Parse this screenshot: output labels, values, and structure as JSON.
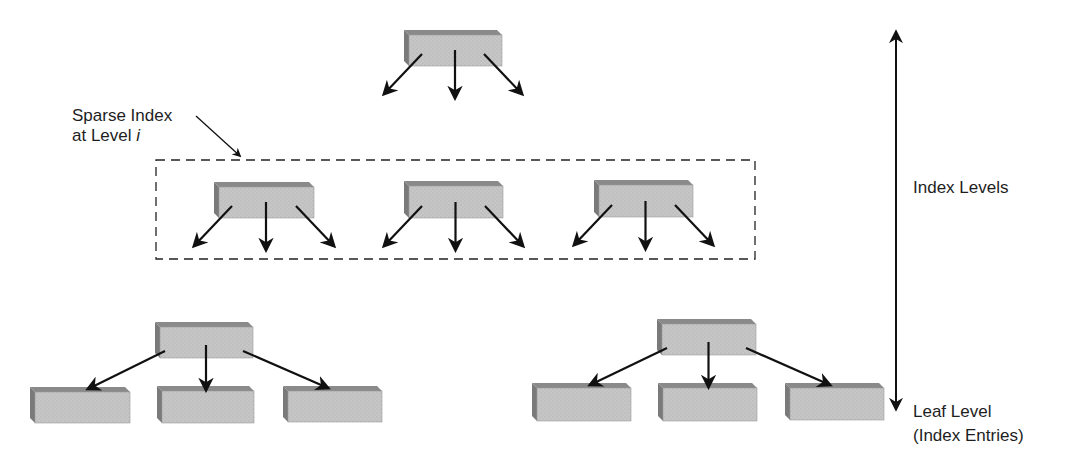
{
  "labels": {
    "sparse_index_line1": "Sparse Index",
    "sparse_index_line2_prefix": "at Level ",
    "sparse_index_line2_var": "i",
    "index_levels": "Index Levels",
    "leaf_level_line1": "Leaf Level",
    "leaf_level_line2": "(Index Entries)"
  },
  "colors": {
    "box_face": "#c4c4c4",
    "box_top": "#8a8a8a",
    "box_side": "#7a7a7a",
    "arrow": "#111111",
    "dashed_border": "#222222",
    "background": "#ffffff"
  },
  "diagram": {
    "root_box": {
      "x": 404,
      "y": 30,
      "w": 98,
      "h": 36
    },
    "sparse_level_group": {
      "x": 156,
      "y": 160,
      "w": 599,
      "h": 99
    },
    "sparse_level_boxes": [
      {
        "x": 214,
        "y": 182,
        "w": 100,
        "h": 36
      },
      {
        "x": 404,
        "y": 181,
        "w": 99,
        "h": 37
      },
      {
        "x": 594,
        "y": 180,
        "w": 99,
        "h": 37
      }
    ],
    "subtrees": [
      {
        "parent": {
          "x": 155,
          "y": 322,
          "w": 98,
          "h": 36
        },
        "leaves": [
          {
            "x": 30,
            "y": 387,
            "w": 100,
            "h": 36
          },
          {
            "x": 157,
            "y": 386,
            "w": 97,
            "h": 37
          },
          {
            "x": 283,
            "y": 386,
            "w": 99,
            "h": 36
          }
        ]
      },
      {
        "parent": {
          "x": 657,
          "y": 319,
          "w": 99,
          "h": 36
        },
        "leaves": [
          {
            "x": 532,
            "y": 383,
            "w": 99,
            "h": 38
          },
          {
            "x": 658,
            "y": 383,
            "w": 99,
            "h": 38
          },
          {
            "x": 785,
            "y": 383,
            "w": 99,
            "h": 37
          }
        ]
      }
    ],
    "level_axis": {
      "x": 896,
      "y1": 28,
      "y2": 413
    }
  }
}
